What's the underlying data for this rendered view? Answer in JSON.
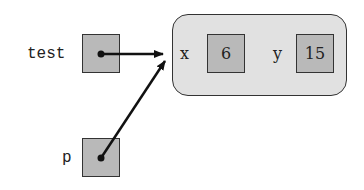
{
  "variables": [
    {
      "name": "test",
      "points_to": "point-object"
    },
    {
      "name": "p",
      "points_to": "point-object"
    }
  ],
  "object": {
    "fields": [
      {
        "name": "x",
        "value": "6"
      },
      {
        "name": "y",
        "value": "15"
      }
    ]
  },
  "colors": {
    "cell_fill": "#b9b9b9",
    "object_fill": "#e1e1e1",
    "stroke": "#222222"
  }
}
